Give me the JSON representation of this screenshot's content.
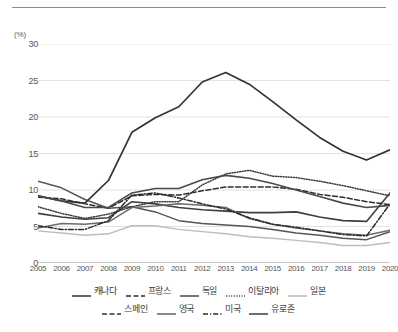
{
  "chart_data": {
    "type": "line",
    "title": "",
    "subtitle": "",
    "xlabel": "",
    "ylabel": "(%)",
    "unit_label": "(%)",
    "x": [
      2005,
      2006,
      2007,
      2008,
      2009,
      2010,
      2011,
      2012,
      2013,
      2014,
      2015,
      2016,
      2017,
      2018,
      2019,
      2020
    ],
    "categories": [
      "2005",
      "2006",
      "2007",
      "2008",
      "2009",
      "2010",
      "2011",
      "2012",
      "2013",
      "2014",
      "2015",
      "2016",
      "2017",
      "2018",
      "2019",
      "2020"
    ],
    "ylim": [
      0,
      30
    ],
    "yticks": [
      0,
      5,
      10,
      15,
      20,
      25,
      30
    ],
    "ytick_labels": [
      "0",
      "5",
      "10",
      "15",
      "20",
      "25",
      "30"
    ],
    "xlim": [
      2005,
      2020
    ],
    "grid": "horizontal",
    "legend_position": "bottom",
    "series": [
      {
        "name": "캐나다",
        "style": "solid",
        "color": "#3f3f3f",
        "width": 1.6,
        "values": [
          6.8,
          6.3,
          6.0,
          6.2,
          8.4,
          8.1,
          7.6,
          7.3,
          7.1,
          6.9,
          6.9,
          7.0,
          6.3,
          5.8,
          5.7,
          9.6
        ]
      },
      {
        "name": "프랑스",
        "style": "dashed",
        "color": "#2e2e2e",
        "width": 1.5,
        "values": [
          9.0,
          8.8,
          8.1,
          7.5,
          9.2,
          9.4,
          9.3,
          9.9,
          10.4,
          10.4,
          10.4,
          10.1,
          9.4,
          9.0,
          8.4,
          8.0
        ]
      },
      {
        "name": "독일",
        "style": "solid",
        "color": "#555555",
        "width": 1.5,
        "values": [
          11.2,
          10.3,
          8.7,
          7.5,
          7.7,
          7.0,
          5.8,
          5.4,
          5.2,
          5.0,
          4.6,
          4.1,
          3.8,
          3.4,
          3.2,
          4.3
        ]
      },
      {
        "name": "이탈리아",
        "style": "dotted",
        "color": "#3a3a3a",
        "width": 1.5,
        "values": [
          7.7,
          6.8,
          6.1,
          6.7,
          7.7,
          8.4,
          8.4,
          10.7,
          12.2,
          12.7,
          11.9,
          11.7,
          11.2,
          10.6,
          9.9,
          9.2
        ]
      },
      {
        "name": "일본",
        "style": "solid",
        "color": "#bdbdbd",
        "width": 1.4,
        "values": [
          4.4,
          4.1,
          3.8,
          4.0,
          5.1,
          5.1,
          4.6,
          4.3,
          4.0,
          3.6,
          3.4,
          3.1,
          2.8,
          2.4,
          2.4,
          2.8
        ]
      },
      {
        "name": "스페인",
        "style": "solid",
        "color": "#333333",
        "width": 1.7,
        "values": [
          9.2,
          8.5,
          8.2,
          11.3,
          17.9,
          19.9,
          21.4,
          24.8,
          26.1,
          24.5,
          22.1,
          19.6,
          17.2,
          15.3,
          14.1,
          15.5
        ]
      },
      {
        "name": "영국",
        "style": "solid",
        "color": "#6a6a6a",
        "width": 1.5,
        "values": [
          4.8,
          5.4,
          5.3,
          5.6,
          7.6,
          7.8,
          8.1,
          7.9,
          7.6,
          6.1,
          5.3,
          4.8,
          4.4,
          4.0,
          3.8,
          4.5
        ]
      },
      {
        "name": "미국",
        "style": "dashdot",
        "color": "#2b2b2b",
        "width": 1.5,
        "values": [
          5.1,
          4.6,
          4.6,
          5.8,
          9.3,
          9.6,
          8.9,
          8.1,
          7.4,
          6.2,
          5.3,
          4.9,
          4.4,
          3.9,
          3.7,
          8.1
        ]
      },
      {
        "name": "유로존",
        "style": "solid",
        "color": "#4a4a4a",
        "width": 1.6,
        "values": [
          9.2,
          8.5,
          7.6,
          7.6,
          9.6,
          10.2,
          10.2,
          11.4,
          12.0,
          11.6,
          10.9,
          10.0,
          9.1,
          8.2,
          7.6,
          7.9
        ]
      }
    ]
  },
  "legend": {
    "rows": [
      [
        {
          "label": "캐나다",
          "style": "solid",
          "color": "#3f3f3f"
        },
        {
          "label": "프랑스",
          "style": "dashed",
          "color": "#2e2e2e"
        },
        {
          "label": "독일",
          "style": "solid",
          "color": "#555555"
        },
        {
          "label": "이탈리아",
          "style": "dotted",
          "color": "#3a3a3a"
        },
        {
          "label": "일본",
          "style": "solid",
          "color": "#bdbdbd"
        }
      ],
      [
        {
          "label": "스페인",
          "style": "dashed",
          "color": "#333333"
        },
        {
          "label": "영국",
          "style": "solid",
          "color": "#6a6a6a"
        },
        {
          "label": "미국",
          "style": "dashdot",
          "color": "#2b2b2b"
        },
        {
          "label": "유로존",
          "style": "solid",
          "color": "#4a4a4a"
        }
      ]
    ]
  },
  "axis": {
    "unit": "(%)"
  }
}
